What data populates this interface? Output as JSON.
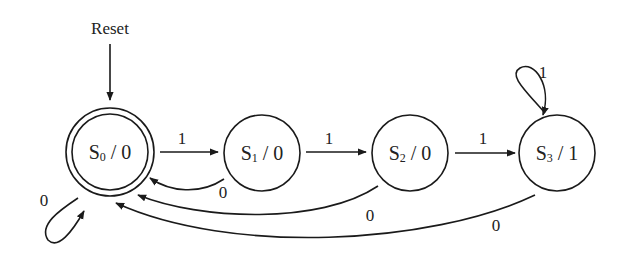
{
  "diagram": {
    "type": "finite-state-machine (Moore)",
    "reset_label": "Reset",
    "states": [
      {
        "id": "S0",
        "letter": "S",
        "index": "0",
        "output": "0",
        "initial": true
      },
      {
        "id": "S1",
        "letter": "S",
        "index": "1",
        "output": "0"
      },
      {
        "id": "S2",
        "letter": "S",
        "index": "2",
        "output": "0"
      },
      {
        "id": "S3",
        "letter": "S",
        "index": "3",
        "output": "1"
      }
    ],
    "transitions": [
      {
        "from": "S0",
        "to": "S1",
        "label": "1"
      },
      {
        "from": "S1",
        "to": "S2",
        "label": "1"
      },
      {
        "from": "S2",
        "to": "S3",
        "label": "1"
      },
      {
        "from": "S3",
        "to": "S3",
        "label": "1"
      },
      {
        "from": "S0",
        "to": "S0",
        "label": "0"
      },
      {
        "from": "S1",
        "to": "S0",
        "label": "0"
      },
      {
        "from": "S2",
        "to": "S0",
        "label": "0"
      },
      {
        "from": "S3",
        "to": "S0",
        "label": "0"
      }
    ]
  }
}
